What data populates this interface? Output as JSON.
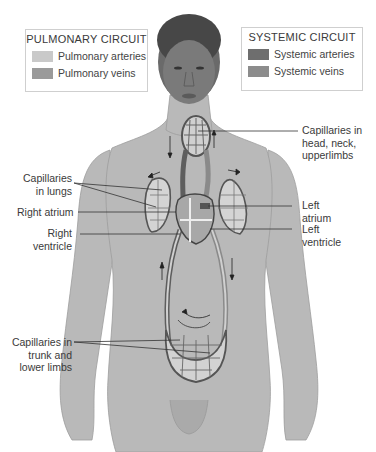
{
  "legend_pulmonary": {
    "title": "PULMONARY CIRCUIT",
    "items": [
      {
        "label": "Pulmonary arteries",
        "color": "#c9c9c9"
      },
      {
        "label": "Pulmonary veins",
        "color": "#9a9a9a"
      }
    ]
  },
  "legend_systemic": {
    "title": "SYSTEMIC CIRCUIT",
    "items": [
      {
        "label": "Systemic arteries",
        "color": "#6e6e6e"
      },
      {
        "label": "Systemic veins",
        "color": "#8c8c8c"
      }
    ]
  },
  "labels": {
    "capillaries_head": [
      "Capillaries in",
      "head, neck,",
      "upperlimbs"
    ],
    "capillaries_lungs": [
      "Capillaries",
      "in lungs"
    ],
    "right_atrium": "Right atrium",
    "right_ventricle": [
      "Right",
      "ventricle"
    ],
    "left_atrium": [
      "Left",
      "atrium"
    ],
    "left_ventricle": [
      "Left",
      "ventricle"
    ],
    "capillaries_trunk": [
      "Capillaries in",
      "trunk and",
      "lower limbs"
    ]
  },
  "colors": {
    "skin": "#b8b8b8",
    "skin_shadow": "#a3a3a3",
    "hair": "#4a4a4a",
    "vessel_dark": "#5e5e5e",
    "vessel_light": "#d4d4d4",
    "leader_line": "#333333"
  }
}
